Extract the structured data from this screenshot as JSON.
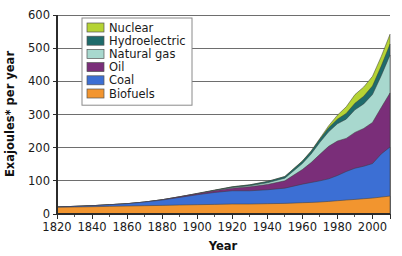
{
  "chart_data": {
    "type": "area",
    "title": "",
    "xlabel": "Year",
    "ylabel": "Exajoules* per year",
    "xlim": [
      1820,
      2010
    ],
    "ylim": [
      0,
      600
    ],
    "xticks": [
      1820,
      1840,
      1860,
      1880,
      1900,
      1920,
      1940,
      1960,
      1980,
      2000
    ],
    "yticks": [
      0,
      100,
      200,
      300,
      400,
      500,
      600
    ],
    "xtick_minor_step": 10,
    "grid": true,
    "stacked": true,
    "legend_position": "top-left-inside",
    "x": [
      1820,
      1830,
      1840,
      1850,
      1860,
      1870,
      1880,
      1890,
      1900,
      1910,
      1920,
      1930,
      1940,
      1950,
      1960,
      1965,
      1970,
      1975,
      1980,
      1985,
      1990,
      1995,
      2000,
      2005,
      2010
    ],
    "series": [
      {
        "name": "Biofuels",
        "color": "#F2952F",
        "values": [
          20,
          21,
          22,
          23,
          24,
          25,
          26,
          27,
          28,
          29,
          30,
          30,
          31,
          32,
          34,
          35,
          36,
          38,
          40,
          42,
          44,
          46,
          48,
          51,
          54
        ]
      },
      {
        "name": "Coal",
        "color": "#3C6FD4",
        "values": [
          1,
          2,
          3,
          5,
          7,
          11,
          16,
          23,
          30,
          36,
          40,
          40,
          42,
          46,
          56,
          60,
          64,
          68,
          76,
          86,
          94,
          98,
          104,
          130,
          148
        ]
      },
      {
        "name": "Oil",
        "color": "#7A2E79",
        "values": [
          0,
          0,
          0,
          0,
          0,
          0,
          1,
          2,
          3,
          5,
          8,
          12,
          16,
          22,
          44,
          60,
          80,
          98,
          104,
          100,
          108,
          114,
          124,
          140,
          163
        ]
      },
      {
        "name": "Natural gas",
        "color": "#A8D8CE",
        "values": [
          0,
          0,
          0,
          0,
          0,
          0,
          0,
          0,
          0,
          1,
          2,
          3,
          5,
          8,
          18,
          26,
          36,
          44,
          52,
          58,
          68,
          74,
          84,
          96,
          114
        ]
      },
      {
        "name": "Hydroelectric",
        "color": "#1E6B6B",
        "values": [
          0,
          0,
          0,
          0,
          0,
          0,
          0,
          0,
          1,
          1,
          2,
          3,
          4,
          5,
          7,
          8,
          10,
          12,
          14,
          17,
          20,
          23,
          26,
          29,
          33
        ]
      },
      {
        "name": "Nuclear",
        "color": "#B5D334",
        "values": [
          0,
          0,
          0,
          0,
          0,
          0,
          0,
          0,
          0,
          0,
          0,
          0,
          0,
          0,
          1,
          1,
          2,
          6,
          12,
          20,
          26,
          28,
          29,
          29,
          30
        ]
      }
    ],
    "legend_entries": [
      {
        "label": "Nuclear",
        "color": "#B5D334"
      },
      {
        "label": "Hydroelectric",
        "color": "#1E6B6B"
      },
      {
        "label": "Natural gas",
        "color": "#A8D8CE"
      },
      {
        "label": "Oil",
        "color": "#7A2E79"
      },
      {
        "label": "Coal",
        "color": "#3C6FD4"
      },
      {
        "label": "Biofuels",
        "color": "#F2952F"
      }
    ]
  }
}
